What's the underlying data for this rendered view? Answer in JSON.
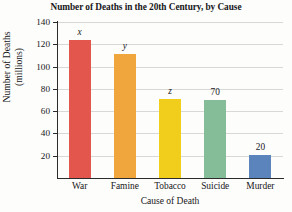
{
  "chart_data": {
    "type": "bar",
    "title": "Number of Deaths in the 20th Century, by Cause",
    "xlabel": "Cause of Death",
    "ylabel_lines": [
      "Number of Deaths",
      "(millions)"
    ],
    "ylabel": "Number of Deaths (millions)",
    "categories": [
      "War",
      "Famine",
      "Tobacco",
      "Suicide",
      "Murder"
    ],
    "values": [
      124,
      111,
      71,
      70,
      21
    ],
    "point_labels": [
      "x",
      "y",
      "z",
      "70",
      "20"
    ],
    "point_label_styles": [
      "italic",
      "italic",
      "italic",
      "normal",
      "normal"
    ],
    "colors": [
      "#e2564e",
      "#f0a63c",
      "#f2ce1c",
      "#85bd99",
      "#5b84bd"
    ],
    "ylim": [
      0,
      140
    ],
    "yticks": [
      140,
      120,
      100,
      80,
      60,
      40,
      20
    ],
    "ytick_labels": [
      "140",
      "120",
      "100",
      "80",
      "60",
      "40",
      "20"
    ],
    "grid": true,
    "legend": "none",
    "background": "#fdfdfb",
    "axis_color": "#2b2b2b",
    "gridline_color": "#d8d8d4"
  }
}
